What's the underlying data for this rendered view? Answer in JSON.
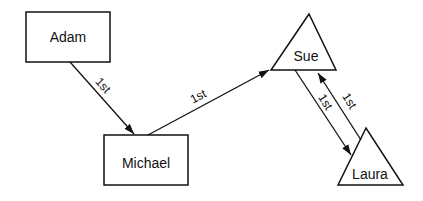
{
  "diagram": {
    "nodes": [
      {
        "id": "adam",
        "label": "Adam",
        "shape": "rectangle"
      },
      {
        "id": "michael",
        "label": "Michael",
        "shape": "rectangle"
      },
      {
        "id": "sue",
        "label": "Sue",
        "shape": "triangle"
      },
      {
        "id": "laura",
        "label": "Laura",
        "shape": "triangle"
      }
    ],
    "edges": [
      {
        "from": "Adam",
        "to": "Michael",
        "label": "1st"
      },
      {
        "from": "Michael",
        "to": "Sue",
        "label": "1st"
      },
      {
        "from": "Sue",
        "to": "Laura",
        "label": "1st"
      },
      {
        "from": "Laura",
        "to": "Sue",
        "label": "1st"
      }
    ],
    "colors": {
      "stroke": "#111111",
      "background": "#ffffff"
    }
  }
}
